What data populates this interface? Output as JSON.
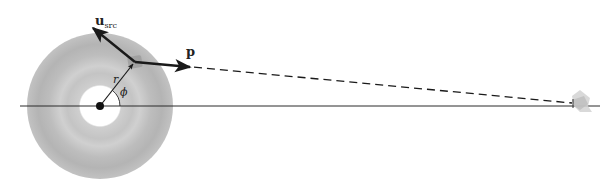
{
  "diagram": {
    "type": "geometry-schematic",
    "labels": {
      "u_src_main": "u",
      "u_src_sub": "src",
      "p": "p",
      "r": "r",
      "phi": "ϕ"
    },
    "elements": [
      {
        "name": "accretion-disk",
        "shape": "annulus",
        "center": [
          100,
          106
        ],
        "outer_radius": 73,
        "inner_radius": 20,
        "fill": "#b8b8b8"
      },
      {
        "name": "central-mass",
        "shape": "dot",
        "center": [
          100,
          106
        ],
        "radius": 4,
        "fill": "#111111"
      },
      {
        "name": "axis-line",
        "shape": "line",
        "from": [
          20,
          106
        ],
        "to": [
          600,
          106
        ]
      },
      {
        "name": "radius-vector-r",
        "shape": "arrow",
        "from": [
          100,
          106
        ],
        "to": [
          134,
          63
        ]
      },
      {
        "name": "u-src-vector",
        "shape": "arrow",
        "from": [
          135,
          62
        ],
        "to": [
          92,
          27
        ]
      },
      {
        "name": "p-vector",
        "shape": "arrow",
        "from": [
          135,
          62
        ],
        "to": [
          192,
          67
        ]
      },
      {
        "name": "light-path",
        "shape": "dashed-line",
        "from": [
          192,
          67
        ],
        "to": [
          572,
          103
        ]
      },
      {
        "name": "observer",
        "shape": "eye-telescope",
        "position": [
          578,
          103
        ]
      }
    ],
    "colors": {
      "disk_outer": "#b0b0b0",
      "disk_band": "#c8c8c8",
      "ink": "#1a1a1a",
      "source_patch": "#9a9a9a"
    }
  }
}
